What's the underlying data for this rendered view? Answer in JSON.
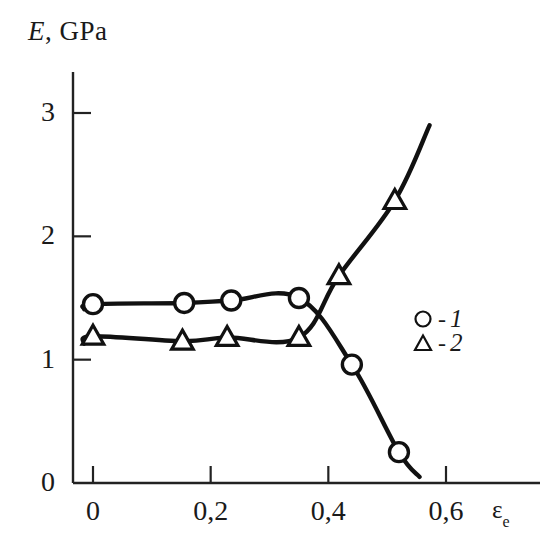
{
  "chart_data": {
    "type": "line",
    "title": "E, GPa",
    "ylabel": "E, GPa",
    "xlabel": "εe",
    "xlabel_base": "ε",
    "xlabel_sub": "e",
    "grid": false,
    "legend_position": "right-middle",
    "xlim": [
      -0.02,
      0.68
    ],
    "ylim": [
      0,
      3.22
    ],
    "xticks": [
      0,
      0.2,
      0.4,
      0.6
    ],
    "xtick_labels": [
      "0",
      "0,2",
      "0,4",
      "0,6"
    ],
    "yticks": [
      0,
      1,
      2,
      3
    ],
    "ytick_labels": [
      "0",
      "1",
      "2",
      "3"
    ],
    "series": [
      {
        "name": "1",
        "legend_label": "1",
        "marker": "circle",
        "color": "#111111",
        "points": [
          {
            "x": 0.0,
            "y": 1.45
          },
          {
            "x": 0.155,
            "y": 1.46
          },
          {
            "x": 0.235,
            "y": 1.48
          },
          {
            "x": 0.35,
            "y": 1.5
          },
          {
            "x": 0.44,
            "y": 0.96
          },
          {
            "x": 0.52,
            "y": 0.25
          }
        ],
        "line_start": {
          "x": -0.015,
          "y": 1.41
        },
        "line_end": {
          "x": 0.555,
          "y": 0.05
        }
      },
      {
        "name": "2",
        "legend_label": "2",
        "marker": "triangle",
        "color": "#111111",
        "points": [
          {
            "x": 0.0,
            "y": 1.19
          },
          {
            "x": 0.152,
            "y": 1.15
          },
          {
            "x": 0.228,
            "y": 1.18
          },
          {
            "x": 0.35,
            "y": 1.18
          },
          {
            "x": 0.418,
            "y": 1.68
          },
          {
            "x": 0.513,
            "y": 2.29
          }
        ],
        "line_start": {
          "x": -0.015,
          "y": 1.13
        },
        "line_end": {
          "x": 0.572,
          "y": 2.9
        }
      }
    ]
  },
  "axes": {
    "title_e": "E",
    "title_comma_gpa": ", GPa"
  },
  "legend": {
    "items": [
      {
        "symbol": "circle",
        "dash": "-",
        "label": "1"
      },
      {
        "symbol": "triangle",
        "dash": "-",
        "label": "2"
      }
    ]
  }
}
